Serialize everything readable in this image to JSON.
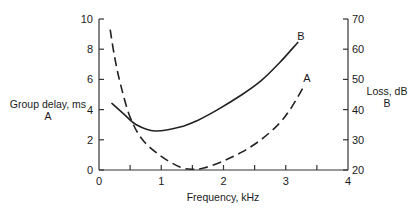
{
  "chart_data": {
    "type": "line",
    "title": "",
    "xlabel": "Frequency, kHz",
    "ylabel_left": [
      "Group delay, ms",
      "A"
    ],
    "ylabel_right": [
      "Loss, dB",
      "B"
    ],
    "xlim": [
      0,
      4
    ],
    "ylim_left": [
      0,
      10
    ],
    "ylim_right": [
      20,
      70
    ],
    "x_ticks": [
      0,
      1,
      2,
      3,
      4
    ],
    "x_minor_ticks": [
      0.5,
      1.5,
      2.5,
      3.5
    ],
    "y_left_ticks": [
      0,
      2,
      4,
      6,
      8,
      10
    ],
    "y_right_ticks": [
      20,
      30,
      40,
      50,
      60,
      70
    ],
    "grid": false,
    "legend": "inline curve labels",
    "series": [
      {
        "name": "A",
        "axis": "left",
        "style": "dashed",
        "quantity": "Group delay (ms)",
        "x": [
          0.18,
          0.25,
          0.35,
          0.5,
          0.7,
          1.0,
          1.3,
          1.5,
          1.7,
          2.0,
          2.3,
          2.6,
          2.9,
          3.1,
          3.3
        ],
        "y": [
          9.3,
          7.5,
          5.6,
          3.5,
          2.0,
          0.9,
          0.2,
          0.05,
          0.15,
          0.6,
          1.2,
          2.0,
          3.1,
          4.2,
          5.6
        ]
      },
      {
        "name": "B",
        "axis": "right",
        "style": "solid",
        "quantity": "Loss (dB)",
        "x": [
          0.2,
          0.4,
          0.6,
          0.9,
          1.3,
          1.6,
          1.9,
          2.3,
          2.6,
          2.9,
          3.2
        ],
        "y": [
          42.2,
          38.5,
          35.0,
          32.9,
          34.2,
          36.6,
          39.9,
          45.0,
          49.5,
          55.5,
          62.4
        ]
      }
    ]
  }
}
